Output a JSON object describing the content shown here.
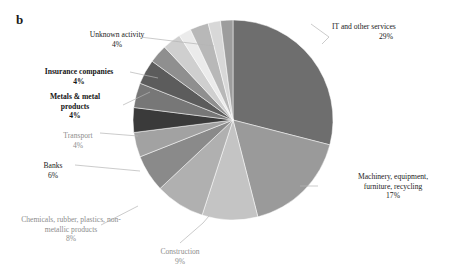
{
  "figure": {
    "panel_label": "b",
    "background": "#ffffff"
  },
  "chart_data": {
    "type": "pie",
    "title": "",
    "xlabel": "",
    "ylabel": "",
    "legend_position": "none",
    "grid": false,
    "units": "percent",
    "categories": [
      "IT and other services",
      "Machinery, equipment, furniture, recycling",
      "Construction",
      "Chemicals, rubber, plastics, non-metallic products",
      "Banks",
      "Transport",
      "Metals & metal products",
      "Insurance companies",
      "Unknown activity"
    ],
    "values": [
      29,
      17,
      9,
      8,
      6,
      4,
      4,
      4,
      4
    ],
    "labeled_total": 85,
    "unlabeled_remainder": 15,
    "slices": [
      {
        "name": "IT and other services",
        "label": "IT and other services",
        "pct": "29%",
        "value": 29,
        "color": "#6e6e6e",
        "bold": false
      },
      {
        "name": "Machinery, equipment, furniture, recycling",
        "label": "Machinery, equipment,\nfurniture, recycling",
        "pct": "17%",
        "value": 17,
        "color": "#9a9a9a",
        "bold": false
      },
      {
        "name": "Construction",
        "label": "Construction",
        "pct": "9%",
        "value": 9,
        "color": "#c4c4c4",
        "bold": false
      },
      {
        "name": "Chemicals, rubber, plastics, non-metallic products",
        "label": "Chemicals, rubber, plastics, non-\nmetallic products",
        "pct": "8%",
        "value": 8,
        "color": "#b0b0b0",
        "bold": false
      },
      {
        "name": "Banks",
        "label": "Banks",
        "pct": "6%",
        "value": 6,
        "color": "#8a8a8a",
        "bold": false
      },
      {
        "name": "Transport",
        "label": "Transport",
        "pct": "4%",
        "value": 4,
        "color": "#a2a2a2",
        "bold": false
      },
      {
        "name": "Metals & metal products",
        "label": "Metals & metal\nproducts",
        "pct": "4%",
        "value": 4,
        "color": "#3a3a3a",
        "bold": true
      },
      {
        "name": "Insurance companies",
        "label": "Insurance companies",
        "pct": "4%",
        "value": 4,
        "color": "#777777",
        "bold": true
      },
      {
        "name": "Unknown activity",
        "label": "Unknown activity",
        "pct": "4%",
        "value": 4,
        "color": "#5c5c5c",
        "bold": false
      }
    ],
    "unlabeled_slices": [
      {
        "name": "sliver-1",
        "value": 3,
        "color": "#8f8f8f"
      },
      {
        "name": "sliver-2",
        "value": 3,
        "color": "#cfcfcf"
      },
      {
        "name": "sliver-3",
        "value": 2,
        "color": "#ebebeb"
      },
      {
        "name": "sliver-4",
        "value": 3,
        "color": "#b8b8b8"
      },
      {
        "name": "sliver-5",
        "value": 2,
        "color": "#d8d8d8"
      },
      {
        "name": "sliver-6",
        "value": 2,
        "color": "#9d9d9d"
      }
    ]
  },
  "labels": {
    "it_services": {
      "text": "IT and other services",
      "pct": "29%"
    },
    "machinery": {
      "text": "Machinery, equipment,\nfurniture, recycling",
      "pct": "17%"
    },
    "construction": {
      "text": "Construction",
      "pct": "9%"
    },
    "chemicals": {
      "text": "Chemicals, rubber, plastics, non-\nmetallic products",
      "pct": "8%"
    },
    "banks": {
      "text": "Banks",
      "pct": "6%"
    },
    "transport": {
      "text": "Transport",
      "pct": "4%"
    },
    "metals": {
      "text": "Metals & metal\nproducts",
      "pct": "4%"
    },
    "insurance": {
      "text": "Insurance companies",
      "pct": "4%"
    },
    "unknown": {
      "text": "Unknown activity",
      "pct": "4%"
    }
  }
}
